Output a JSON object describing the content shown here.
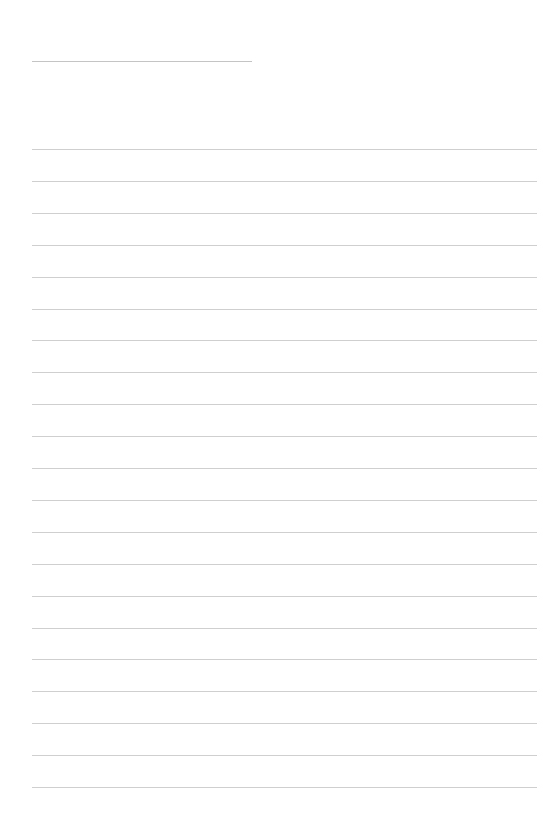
{
  "page": {
    "type": "lined-paper",
    "background": "#ffffff",
    "line_color": "#cfcfcf",
    "title_line": {
      "left": 32,
      "top": 61,
      "width": 220
    },
    "rules": {
      "count": 21,
      "first_top": 149,
      "spacing": 31.9,
      "left": 32,
      "width": 505
    }
  }
}
